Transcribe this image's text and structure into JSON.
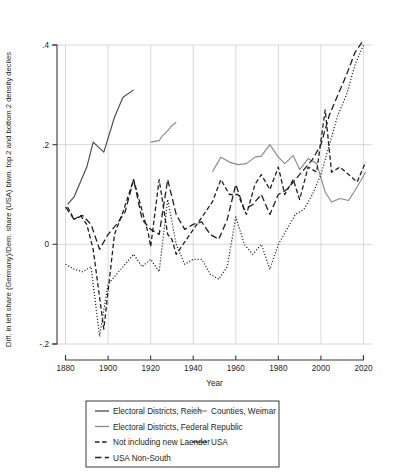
{
  "chart_data": {
    "type": "line",
    "title": "",
    "xlabel": "Year",
    "ylabel": "Diff. in left share (Germany)/Dem. share (USA) btwn. top 2 and bottom 2 density deciles",
    "xlim": [
      1876,
      2024
    ],
    "ylim": [
      -0.2,
      0.4
    ],
    "xticks": [
      1880,
      1900,
      1920,
      1940,
      1960,
      1980,
      2000,
      2020
    ],
    "xticklabels": [
      "1880",
      "1900",
      "1920",
      "1940",
      "1960",
      "1980",
      "2000",
      "2020"
    ],
    "yticks": [
      -0.2,
      0,
      0.2,
      0.4
    ],
    "yticklabels": [
      "-.2",
      "0",
      ".2",
      ".4"
    ],
    "grid": "both",
    "legend_position": "below-center",
    "series": [
      {
        "name": "Electoral Districts, Reich",
        "style": "solid",
        "color": "#4a4a4a",
        "width": 1.15,
        "x": [
          1881,
          1884,
          1887,
          1890,
          1893,
          1898,
          1903,
          1907,
          1912
        ],
        "y": [
          0.08,
          0.095,
          0.125,
          0.155,
          0.205,
          0.185,
          0.255,
          0.295,
          0.31
        ]
      },
      {
        "name": "Counties, Weimar",
        "style": "solid",
        "color": "#8a8a8a",
        "width": 1.15,
        "x": [
          1920,
          1924,
          1925,
          1928,
          1930,
          1932
        ],
        "y": [
          0.205,
          0.208,
          0.215,
          0.228,
          0.238,
          0.245
        ]
      },
      {
        "name": "Electoral Districts, Federal Republic",
        "style": "solid",
        "color": "#8a8a8a",
        "width": 1.15,
        "x": [
          1949,
          1953,
          1957,
          1961,
          1965,
          1969,
          1972,
          1976,
          1980,
          1983,
          1987,
          1990,
          1994,
          1998,
          2002,
          2005,
          2009,
          2013,
          2017,
          2021
        ],
        "y": [
          0.145,
          0.175,
          0.165,
          0.16,
          0.162,
          0.175,
          0.177,
          0.2,
          0.175,
          0.162,
          0.178,
          0.15,
          0.172,
          0.162,
          0.105,
          0.085,
          0.092,
          0.088,
          0.115,
          0.145
        ]
      },
      {
        "name": "Not including new Laender",
        "style": "dashed",
        "color": "#231f20",
        "width": 1.3,
        "x": [
          1881,
          1884,
          1887,
          1890,
          1893,
          1898,
          1903,
          1907,
          1912,
          1919,
          1920,
          1924,
          1928,
          1930,
          1932,
          1949,
          1953,
          1957,
          1961,
          1965,
          1969,
          1972,
          1976,
          1980,
          1983,
          1987,
          1990,
          1994,
          1998,
          2002,
          2005,
          2009,
          2013,
          2017,
          2021
        ],
        "y": [
          0.075,
          0.05,
          0.058,
          0.04,
          -0.01,
          -0.17,
          0.02,
          0.065,
          0.13,
          0.02,
          -0.005,
          0.13,
          0.02,
          0.01,
          -0.02,
          0.085,
          0.13,
          0.1,
          0.1,
          0.06,
          0.12,
          0.14,
          0.11,
          0.155,
          0.1,
          0.13,
          0.09,
          0.155,
          0.145,
          0.27,
          0.145,
          0.155,
          0.14,
          0.125,
          0.165
        ]
      },
      {
        "name": "USA",
        "style": "dotted",
        "color": "#231f20",
        "width": 1.25,
        "x": [
          1880,
          1884,
          1888,
          1892,
          1896,
          1900,
          1904,
          1908,
          1912,
          1916,
          1920,
          1924,
          1928,
          1932,
          1936,
          1940,
          1944,
          1948,
          1952,
          1956,
          1960,
          1964,
          1968,
          1972,
          1976,
          1980,
          1984,
          1988,
          1992,
          1996,
          2000,
          2004,
          2008,
          2012,
          2016,
          2020
        ],
        "y": [
          -0.04,
          -0.05,
          -0.055,
          -0.045,
          -0.185,
          -0.08,
          -0.06,
          -0.04,
          -0.02,
          -0.045,
          -0.03,
          -0.055,
          0.09,
          0.0,
          -0.04,
          -0.03,
          -0.03,
          -0.06,
          -0.07,
          -0.045,
          0.055,
          0.0,
          -0.02,
          0.0,
          -0.05,
          0.0,
          0.03,
          0.06,
          0.07,
          0.1,
          0.14,
          0.2,
          0.26,
          0.3,
          0.36,
          0.4
        ]
      },
      {
        "name": "USA Non-South",
        "style": "longdash",
        "color": "#231f20",
        "width": 1.3,
        "x": [
          1880,
          1884,
          1888,
          1892,
          1896,
          1900,
          1904,
          1908,
          1912,
          1916,
          1920,
          1924,
          1928,
          1932,
          1936,
          1940,
          1944,
          1948,
          1952,
          1956,
          1960,
          1964,
          1968,
          1972,
          1976,
          1980,
          1984,
          1988,
          1992,
          1996,
          2000,
          2004,
          2008,
          2012,
          2016,
          2020
        ],
        "y": [
          0.075,
          0.05,
          0.058,
          0.04,
          -0.01,
          0.02,
          0.04,
          0.065,
          0.13,
          0.05,
          0.03,
          0.02,
          0.13,
          0.06,
          0.03,
          0.04,
          0.045,
          0.02,
          0.01,
          0.05,
          0.12,
          0.07,
          0.08,
          0.1,
          0.06,
          0.1,
          0.11,
          0.13,
          0.15,
          0.17,
          0.2,
          0.26,
          0.3,
          0.34,
          0.385,
          0.41
        ]
      }
    ],
    "legend_entries": [
      {
        "label": "Electoral Districts, Reich",
        "style": "solid",
        "color": "#4a4a4a"
      },
      {
        "label": "Counties, Weimar",
        "style": "solid",
        "color": "#8a8a8a"
      },
      {
        "label": "Electoral Districts, Federal Republic",
        "style": "solid",
        "color": "#8a8a8a"
      },
      {
        "label": "Not including new Laender",
        "style": "dashed",
        "color": "#231f20"
      },
      {
        "label": "USA",
        "style": "dotted",
        "color": "#231f20"
      },
      {
        "label": "USA Non-South",
        "style": "longdash",
        "color": "#231f20"
      }
    ]
  }
}
